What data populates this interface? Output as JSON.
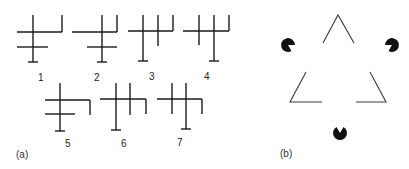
{
  "panel_a": {
    "label": "(a)",
    "figures": [
      {
        "id": "1",
        "label": "1"
      },
      {
        "id": "2",
        "label": "2"
      },
      {
        "id": "3",
        "label": "3"
      },
      {
        "id": "4",
        "label": "4"
      },
      {
        "id": "5",
        "label": "5"
      },
      {
        "id": "6",
        "label": "6"
      },
      {
        "id": "7",
        "label": "7"
      }
    ]
  },
  "panel_b": {
    "label": "(b)",
    "description": "Kanizsa illusory triangle: three pac-man inducers and three line-drawn triangle corners",
    "inducers": 3,
    "corners": 3
  },
  "colors": {
    "ink": "#1a1a1a",
    "background": "#ffffff"
  }
}
